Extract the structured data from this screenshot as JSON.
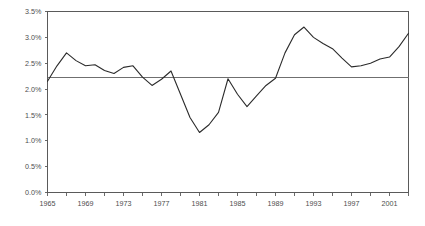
{
  "chart_data": {
    "type": "line",
    "title": "",
    "subtitle": "",
    "xlabel": "",
    "ylabel": "",
    "grid": false,
    "legend": false,
    "legend_position": "none",
    "xlim": [
      1965,
      2003
    ],
    "ylim": [
      0.0,
      3.5
    ],
    "ytick_values": [
      0.0,
      0.5,
      1.0,
      1.5,
      2.0,
      2.5,
      3.0,
      3.5
    ],
    "ytick_labels": [
      "0.0%",
      "0.5%",
      "1.0%",
      "1.5%",
      "2.0%",
      "2.5%",
      "3.0%",
      "3.5%"
    ],
    "xtick_values": [
      1965,
      1967,
      1969,
      1971,
      1973,
      1975,
      1977,
      1979,
      1981,
      1983,
      1985,
      1987,
      1989,
      1991,
      1993,
      1995,
      1997,
      1999,
      2001,
      2003
    ],
    "xtick_labels": [
      "1965",
      "",
      "1969",
      "",
      "1973",
      "",
      "1977",
      "",
      "1981",
      "",
      "1985",
      "",
      "1989",
      "",
      "1993",
      "",
      "1997",
      "",
      "2001",
      ""
    ],
    "xtick_labeled_values": [
      1965,
      1969,
      1973,
      1977,
      1981,
      1985,
      1989,
      1993,
      1997,
      2001
    ],
    "x": [
      1965,
      1966,
      1967,
      1968,
      1969,
      1970,
      1971,
      1972,
      1973,
      1974,
      1975,
      1976,
      1977,
      1978,
      1979,
      1980,
      1981,
      1982,
      1983,
      1984,
      1985,
      1986,
      1987,
      1988,
      1989,
      1990,
      1991,
      1992,
      1993,
      1994,
      1995,
      1996,
      1997,
      1998,
      1999,
      2000,
      2001,
      2002,
      2003
    ],
    "series": [
      {
        "name": "series-1",
        "color": "#2b2b2b",
        "values": [
          2.15,
          2.45,
          2.7,
          2.55,
          2.45,
          2.47,
          2.36,
          2.3,
          2.42,
          2.45,
          2.23,
          2.07,
          2.19,
          2.35,
          1.9,
          1.45,
          1.16,
          1.31,
          1.55,
          2.2,
          1.9,
          1.66,
          1.87,
          2.07,
          2.21,
          2.7,
          3.05,
          3.2,
          3.0,
          2.88,
          2.78,
          2.6,
          2.43,
          2.45,
          2.5,
          2.58,
          2.62,
          2.82,
          3.08
        ]
      }
    ],
    "reference_line": {
      "name": "average-reference-line",
      "value": 2.22,
      "color": "#6f6f6f"
    }
  },
  "axes": {
    "y_axis_name": "y-axis",
    "x_axis_name": "x-axis"
  }
}
